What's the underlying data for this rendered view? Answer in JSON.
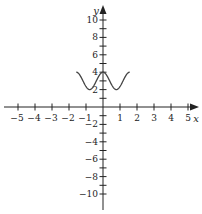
{
  "chart_data": {
    "type": "line",
    "title": "",
    "xlabel": "x",
    "ylabel": "y",
    "xlim": [
      -5.5,
      5.5
    ],
    "ylim": [
      -11,
      11
    ],
    "grid": false,
    "legend": null,
    "x_ticks": [
      -5,
      -4,
      -3,
      -2,
      -1,
      1,
      2,
      3,
      4,
      5
    ],
    "x_tick_labels": [
      "−5",
      "−4",
      "−3",
      "−2",
      "−1",
      "1",
      "2",
      "3",
      "4",
      "5"
    ],
    "y_ticks": [
      -10,
      -8,
      -6,
      -4,
      -2,
      2,
      4,
      6,
      8,
      10
    ],
    "y_tick_labels": [
      "−10",
      "−8",
      "−6",
      "−4",
      "−2",
      "2",
      "4",
      "6",
      "8",
      "10"
    ],
    "series": [
      {
        "name": "y = 3 + cos(4x)",
        "color": "#444444",
        "domain": [
          -1.57,
          1.57
        ],
        "x": [
          -1.57,
          -1.18,
          -0.785,
          -0.39,
          0,
          0.39,
          0.785,
          1.18,
          1.57
        ],
        "y": [
          4,
          3,
          2,
          3,
          4,
          3,
          2,
          3,
          4
        ]
      }
    ]
  },
  "colors": {
    "axis": "#222222",
    "curve": "#444444"
  }
}
